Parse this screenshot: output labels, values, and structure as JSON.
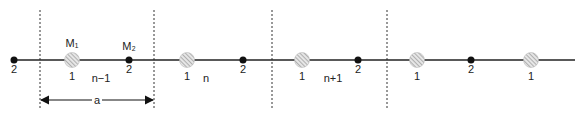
{
  "diagram": {
    "chain_line_y": 60,
    "cell_boundaries_x": [
      40,
      154,
      272,
      387
    ],
    "atoms_type2": [
      {
        "x": 14,
        "label": "2",
        "mass_label": ""
      },
      {
        "x": 129,
        "label": "2",
        "mass_label": "M₂"
      },
      {
        "x": 243,
        "label": "2",
        "mass_label": ""
      },
      {
        "x": 358,
        "label": "2",
        "mass_label": ""
      },
      {
        "x": 471,
        "label": "2",
        "mass_label": ""
      }
    ],
    "atoms_type1": [
      {
        "x": 72,
        "label": "1",
        "mass_label": "M₁"
      },
      {
        "x": 187,
        "label": "1",
        "mass_label": ""
      },
      {
        "x": 302,
        "label": "1",
        "mass_label": ""
      },
      {
        "x": 417,
        "label": "1",
        "mass_label": ""
      },
      {
        "x": 531,
        "label": "1",
        "mass_label": ""
      }
    ],
    "cell_labels": [
      {
        "x": 101,
        "text": "n−1"
      },
      {
        "x": 206,
        "text": "n"
      },
      {
        "x": 333,
        "text": "n+1"
      }
    ],
    "lattice_constant": {
      "label": "a",
      "x1": 40,
      "x2": 154,
      "y": 100
    },
    "colors": {
      "line": "#222222",
      "dashed": "#333333",
      "atom2": "#111111",
      "atom1_fill": "#d8d8d8",
      "hatch": "#888888"
    }
  }
}
